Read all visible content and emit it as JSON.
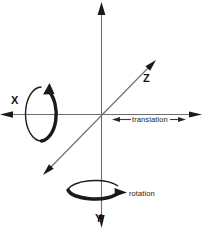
{
  "figure": {
    "background_color": "#ffffff",
    "width": 203,
    "height": 230
  },
  "axes": [
    {
      "id": "x",
      "label": "X",
      "orientation": "horizontal",
      "description": "horizontal axis running left-right through the origin",
      "color": "#6e6e6e"
    },
    {
      "id": "y",
      "label": "Y",
      "orientation": "vertical",
      "description": "vertical axis running top-bottom through the origin",
      "color": "#6e6e6e"
    },
    {
      "id": "z",
      "label": "Z",
      "orientation": "diagonal",
      "description": "diagonal axis running lower-left to upper-right through the origin",
      "color": "#6e6e6e"
    }
  ],
  "annotations": [
    {
      "id": "translation",
      "label": "translation",
      "glyph": "double-headed-arrow",
      "color": "#2a2a2a"
    },
    {
      "id": "rotation",
      "label": "rotation",
      "glyph": "curved-arrow",
      "color": "#1a1a1a"
    }
  ],
  "rotation_indicators": [
    {
      "id": "rotation-about-x",
      "shape": "vertical-ellipse",
      "arrow_direction": "counter-clockwise",
      "color": "#1a1a1a"
    },
    {
      "id": "rotation-about-y",
      "shape": "horizontal-ellipse",
      "arrow_direction": "clockwise",
      "color": "#1a1a1a"
    }
  ]
}
